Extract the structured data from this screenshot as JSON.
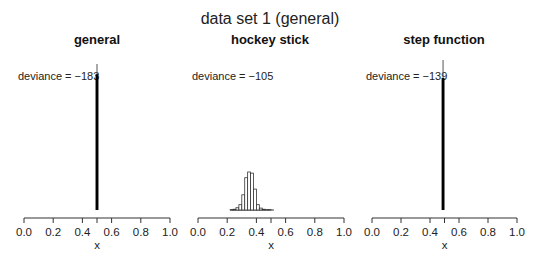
{
  "figure": {
    "title": "data set 1 (general)"
  },
  "chart_data": [
    {
      "type": "bar",
      "title": "general",
      "xlabel": "x",
      "ylabel": "",
      "xlim": [
        0.0,
        1.0
      ],
      "xticks": [
        0.0,
        0.2,
        0.4,
        0.5,
        0.6,
        0.8,
        1.0
      ],
      "xtick_labels": [
        "0.0",
        "0.2",
        "0.4",
        "0.6",
        "0.8",
        "1.0"
      ],
      "annotation": "deviance = −183",
      "description": "histogram of posterior samples concentrated in a narrow spike at x ≈ 0.5",
      "bins": [
        0.49,
        0.51
      ],
      "values": [
        1.0
      ],
      "spike_tail": 0.07,
      "grid": false
    },
    {
      "type": "bar",
      "title": "hockey stick",
      "xlabel": "x",
      "ylabel": "",
      "xlim": [
        0.0,
        1.0
      ],
      "xticks": [
        0.0,
        0.2,
        0.4,
        0.5,
        0.6,
        0.8,
        1.0
      ],
      "xtick_labels": [
        "0.0",
        "0.2",
        "0.4",
        "0.6",
        "0.8",
        "1.0"
      ],
      "annotation": "deviance = −105",
      "description": "histogram of posterior samples centered near x ≈ 0.34",
      "bin_edges": [
        0.22,
        0.24,
        0.26,
        0.28,
        0.3,
        0.32,
        0.34,
        0.36,
        0.38,
        0.4,
        0.42,
        0.44,
        0.46,
        0.48,
        0.5,
        0.52
      ],
      "values": [
        0.01,
        0.02,
        0.06,
        0.14,
        0.4,
        0.85,
        1.0,
        0.97,
        0.55,
        0.14,
        0.05,
        0.02,
        0.01,
        0.01,
        0.0
      ],
      "grid": false
    },
    {
      "type": "bar",
      "title": "step function",
      "xlabel": "x",
      "ylabel": "",
      "xlim": [
        0.0,
        1.0
      ],
      "xticks": [
        0.0,
        0.2,
        0.4,
        0.5,
        0.6,
        0.8,
        1.0
      ],
      "xtick_labels": [
        "0.0",
        "0.2",
        "0.4",
        "0.6",
        "0.8",
        "1.0"
      ],
      "annotation": "deviance = −139",
      "description": "histogram of posterior samples concentrated in a narrow spike at x ≈ 0.49",
      "bins": [
        0.48,
        0.5
      ],
      "values": [
        1.0
      ],
      "spike_tail": 0.12,
      "grid": false
    }
  ]
}
